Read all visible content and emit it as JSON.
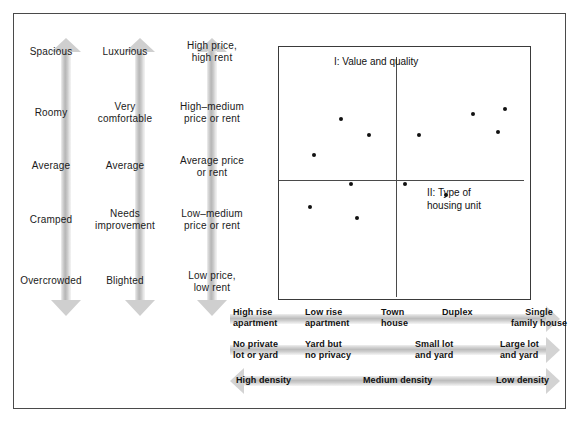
{
  "figure": {
    "background_color": "#ffffff",
    "frame_color": "#4a4a4a",
    "arrow_fill_color": "#cfcfcf",
    "dot_color": "#111111"
  },
  "vertical_scales": [
    {
      "name": "space-scale",
      "direction": "up-and-down",
      "labels": [
        "Spacious",
        "Roomy",
        "Average",
        "Cramped",
        "Overcrowded"
      ]
    },
    {
      "name": "quality-scale",
      "direction": "up-and-down",
      "labels": [
        "Luxurious",
        "Very\ncomfortable",
        "Average",
        "Needs\nimprovement",
        "Blighted"
      ]
    },
    {
      "name": "price-scale",
      "direction": "up-and-down",
      "labels": [
        "High price,\nhigh rent",
        "High–medium\nprice or rent",
        "Average price\nor rent",
        "Low–medium\nprice or rent",
        "Low price,\nlow rent"
      ]
    }
  ],
  "plot": {
    "quadrant_label_1": "I: Value and quality",
    "quadrant_label_2": "II: Type of\nhousing unit"
  },
  "chart_data": {
    "type": "scatter",
    "title": "",
    "xlabel": "II: Type of housing unit",
    "ylabel": "I: Value and quality",
    "grid": false,
    "legend": "none",
    "xlim": [
      0,
      100
    ],
    "ylim": [
      0,
      100
    ],
    "axis_origin": {
      "x": 46,
      "y": 48
    },
    "series": [
      {
        "name": "housing units",
        "points": [
          {
            "x": 24,
            "y": 74
          },
          {
            "x": 36,
            "y": 64
          },
          {
            "x": 12,
            "y": 52
          },
          {
            "x": 28,
            "y": 34
          },
          {
            "x": 10,
            "y": 20
          },
          {
            "x": 31,
            "y": 13
          },
          {
            "x": 58,
            "y": 64
          },
          {
            "x": 82,
            "y": 77
          },
          {
            "x": 96,
            "y": 80
          },
          {
            "x": 93,
            "y": 66
          },
          {
            "x": 52,
            "y": 34
          },
          {
            "x": 70,
            "y": 27
          }
        ]
      }
    ]
  },
  "horizontal_scales": [
    {
      "name": "housing-type-scale",
      "direction": "right",
      "labels": [
        "High rise\napartment",
        "Low rise\napartment",
        "Town\nhouse",
        "Duplex",
        "Single\nfamily house"
      ]
    },
    {
      "name": "lot-and-yard-scale",
      "direction": "right",
      "labels": [
        "No private\nlot or yard",
        "Yard but\nno privacy",
        "Small lot\nand yard",
        "Large lot\nand yard"
      ]
    },
    {
      "name": "density-scale",
      "direction": "both",
      "labels": [
        "High density",
        "Medium density",
        "Low density"
      ]
    }
  ]
}
